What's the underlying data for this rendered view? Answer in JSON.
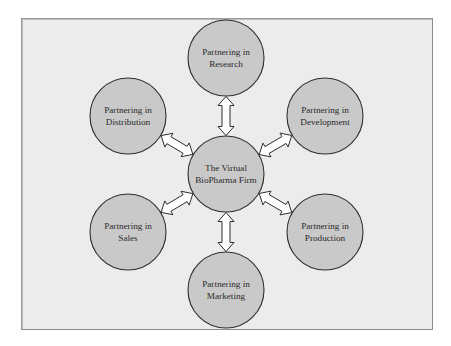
{
  "diagram": {
    "type": "hub-and-spoke",
    "colors": {
      "frame_background": "#ececec",
      "frame_border": "#8c8c8c",
      "node_fill": "#c9c9c9",
      "node_stroke": "#2e2e2e",
      "arrow_fill": "#ffffff",
      "text": "#2a2a2a"
    },
    "hub": {
      "id": "hub",
      "line1": "The Virtual",
      "line2": "BioPharma Firm",
      "cx": 226,
      "cy": 174,
      "r": 38
    },
    "nodes": [
      {
        "id": "research",
        "line1": "Partnering in",
        "line2": "Research",
        "cx": 226,
        "cy": 58,
        "r": 38
      },
      {
        "id": "development",
        "line1": "Partnering in",
        "line2": "Development",
        "cx": 325,
        "cy": 116,
        "r": 38
      },
      {
        "id": "production",
        "line1": "Partnering in",
        "line2": "Production",
        "cx": 325,
        "cy": 232,
        "r": 38
      },
      {
        "id": "marketing",
        "line1": "Partnering in",
        "line2": "Marketing",
        "cx": 226,
        "cy": 290,
        "r": 38
      },
      {
        "id": "sales",
        "line1": "Partnering in",
        "line2": "Sales",
        "cx": 128,
        "cy": 232,
        "r": 38
      },
      {
        "id": "distribution",
        "line1": "Partnering in",
        "line2": "Distribution",
        "cx": 128,
        "cy": 116,
        "r": 38
      }
    ],
    "edges": [
      {
        "from": "hub",
        "to": "research",
        "direction": "bidirectional"
      },
      {
        "from": "hub",
        "to": "development",
        "direction": "bidirectional"
      },
      {
        "from": "hub",
        "to": "production",
        "direction": "bidirectional"
      },
      {
        "from": "hub",
        "to": "marketing",
        "direction": "bidirectional"
      },
      {
        "from": "hub",
        "to": "sales",
        "direction": "bidirectional"
      },
      {
        "from": "hub",
        "to": "distribution",
        "direction": "bidirectional"
      }
    ]
  }
}
